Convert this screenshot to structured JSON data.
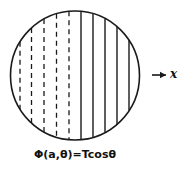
{
  "figure": {
    "name": "circular-domain-with-chords",
    "caption": "Φ(a,θ)=Tcosθ",
    "axis": {
      "arrow_glyph": "→",
      "label": "x"
    },
    "background_color": "#ffffff",
    "stroke_color": "#1a1a1a"
  },
  "chart_data": {
    "type": "diagram",
    "title": "Φ(a,θ)=Tcosθ",
    "xlabel": "x",
    "ylabel": "",
    "grid": false,
    "legend": null,
    "shapes": [
      {
        "kind": "circle",
        "name": "boundary-circle",
        "cx": 75,
        "cy": 75.5,
        "r": 64.5,
        "stroke": "#1a1a1a",
        "stroke_width": 1.5,
        "fill": "none"
      }
    ],
    "chords": [
      {
        "name": "chord-1",
        "x": 20.0,
        "style": "dashed"
      },
      {
        "name": "chord-2",
        "x": 31.5,
        "style": "dashed"
      },
      {
        "name": "chord-3",
        "x": 44.0,
        "style": "dashed"
      },
      {
        "name": "chord-4",
        "x": 56.5,
        "style": "dashed"
      },
      {
        "name": "chord-5",
        "x": 69.0,
        "style": "dashed"
      },
      {
        "name": "chord-6",
        "x": 81.0,
        "style": "solid"
      },
      {
        "name": "chord-7",
        "x": 93.0,
        "style": "solid"
      },
      {
        "name": "chord-8",
        "x": 105.0,
        "style": "solid"
      },
      {
        "name": "chord-9",
        "x": 117.0,
        "style": "solid"
      },
      {
        "name": "chord-10",
        "x": 129.0,
        "style": "solid"
      }
    ],
    "annotations": [
      {
        "name": "x-axis-arrow",
        "text": "→ x",
        "x": 155,
        "y": 75
      },
      {
        "name": "caption",
        "text": "Φ(a,θ)=Tcosθ",
        "x": 75,
        "y": 156
      }
    ]
  }
}
